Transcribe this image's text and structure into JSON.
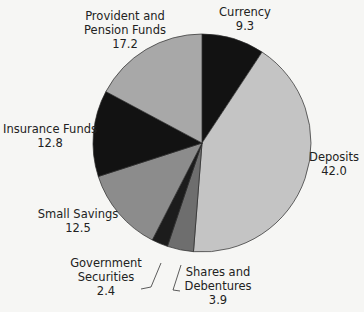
{
  "chart_data": {
    "type": "pie",
    "title": "",
    "start_angle_deg": 0,
    "direction": "clockwise",
    "slices": [
      {
        "label": "Currency",
        "value": 9.3,
        "color": "#121212"
      },
      {
        "label": "Deposits",
        "value": 42.0,
        "color": "#c4c4c4"
      },
      {
        "label": "Shares and Debentures",
        "value": 3.9,
        "color": "#6e6e6e"
      },
      {
        "label": "Government Securities",
        "value": 2.4,
        "color": "#1c1c1c"
      },
      {
        "label": "Small Savings",
        "value": 12.5,
        "color": "#8c8c8c"
      },
      {
        "label": "Insurance Funds",
        "value": 12.8,
        "color": "#121212"
      },
      {
        "label": "Provident and Pension Funds",
        "value": 17.2,
        "color": "#a8a8a8"
      }
    ],
    "categories": [
      "Currency",
      "Deposits",
      "Shares and Debentures",
      "Government Securities",
      "Small Savings",
      "Insurance Funds",
      "Provident and Pension Funds"
    ],
    "values": [
      9.3,
      42.0,
      3.9,
      2.4,
      12.5,
      12.8,
      17.2
    ],
    "legend": "none (direct labels)"
  },
  "labels": {
    "currency": {
      "line1": "Currency",
      "value": "9.3"
    },
    "deposits": {
      "line1": "Deposits",
      "value": "42.0"
    },
    "shares": {
      "line1": "Shares and",
      "line2": "Debentures",
      "value": "3.9"
    },
    "govt": {
      "line1": "Government",
      "line2": "Securities",
      "value": "2.4"
    },
    "small_savings": {
      "line1": "Small Savings",
      "value": "12.5"
    },
    "insurance": {
      "line1": "Insurance Funds",
      "value": "12.8"
    },
    "provident": {
      "line1": "Provident and",
      "line2": "Pension Funds",
      "value": "17.2"
    }
  }
}
